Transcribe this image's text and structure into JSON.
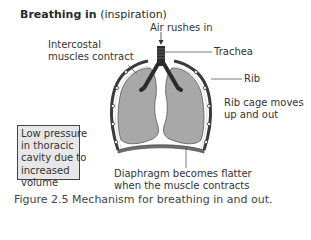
{
  "title": {
    "bold": "Breathing in",
    "sub": " (inspiration)"
  },
  "labels": {
    "air_in": "Air rushes in",
    "trachea": "Trachea",
    "intercostal_line1": "Intercostal",
    "intercostal_line2": "muscles contract",
    "rib": "Rib",
    "rib_cage_line1": "Rib cage moves",
    "rib_cage_line2": "up and out",
    "diaphragm_line1": "Diaphragm becomes flatter",
    "diaphragm_line2": "when the muscle contracts"
  },
  "box": {
    "lines": [
      "Low pressure",
      "in thoracic",
      "cavity due to",
      "increased",
      "volume"
    ]
  },
  "caption": {
    "number": "Figure 2.5",
    "text": " Mechanism for breathing in and out."
  },
  "colors": {
    "lung_fill": "#a8a8a8",
    "bronchi": "#2b2b2b",
    "ribcage": "#3a3a3a",
    "box_fill": "#e7e7e7",
    "diaphragm": "#6f6f6f"
  }
}
